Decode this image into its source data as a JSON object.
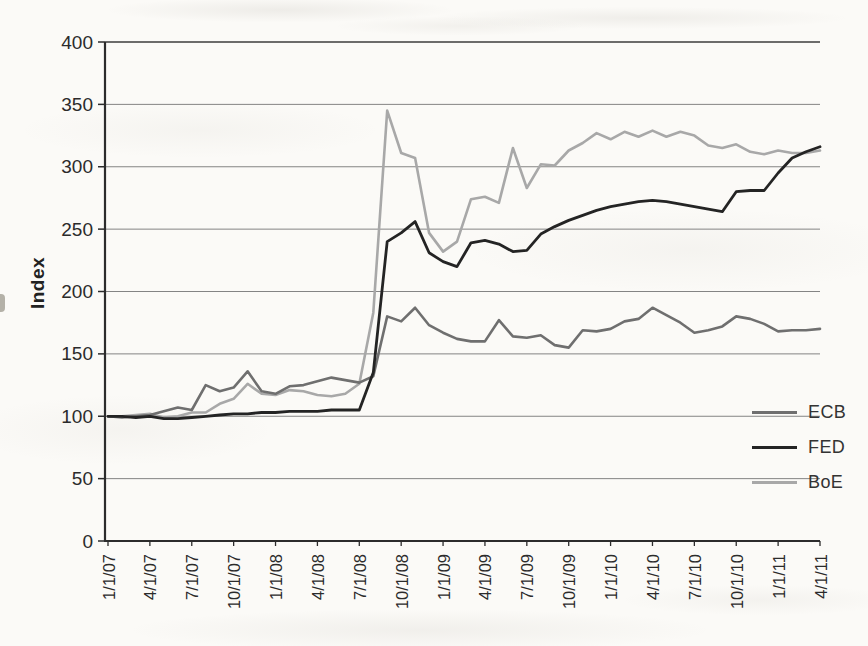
{
  "page": {
    "kind": "scanned-book-chart",
    "background": "#fbfaf7"
  },
  "colors": {
    "axis": "#2c2c2c",
    "grid": "#707070",
    "plot_top_border": "#3c3c3c",
    "tick_text": "#2b2b2b"
  },
  "chart_data": {
    "type": "line",
    "title": "",
    "xlabel": "",
    "ylabel": "Index",
    "ylim": [
      0,
      400
    ],
    "ytick_step": 50,
    "yticks": [
      0,
      50,
      100,
      150,
      200,
      250,
      300,
      350,
      400
    ],
    "grid": "horizontal",
    "legend_position": "inside-right",
    "x": [
      "1/1/07",
      "2/1/07",
      "3/1/07",
      "4/1/07",
      "5/1/07",
      "6/1/07",
      "7/1/07",
      "8/1/07",
      "9/1/07",
      "10/1/07",
      "11/1/07",
      "12/1/07",
      "1/1/08",
      "2/1/08",
      "3/1/08",
      "4/1/08",
      "5/1/08",
      "6/1/08",
      "7/1/08",
      "8/1/08",
      "9/1/08",
      "10/1/08",
      "11/1/08",
      "12/1/08",
      "1/1/09",
      "2/1/09",
      "3/1/09",
      "4/1/09",
      "5/1/09",
      "6/1/09",
      "7/1/09",
      "8/1/09",
      "9/1/09",
      "10/1/09",
      "11/1/09",
      "12/1/09",
      "1/1/10",
      "2/1/10",
      "3/1/10",
      "4/1/10",
      "5/1/10",
      "6/1/10",
      "7/1/10",
      "8/1/10",
      "9/1/10",
      "10/1/10",
      "11/1/10",
      "12/1/10",
      "1/1/11",
      "2/1/11",
      "3/1/11",
      "4/1/11"
    ],
    "xtick_labels": [
      "1/1/07",
      "4/1/07",
      "7/1/07",
      "10/1/07",
      "1/1/08",
      "4/1/08",
      "7/1/08",
      "10/1/08",
      "1/1/09",
      "4/1/09",
      "7/1/09",
      "10/1/09",
      "1/1/10",
      "4/1/10",
      "7/1/10",
      "10/1/10",
      "1/1/11",
      "4/1/11"
    ],
    "series": [
      {
        "name": "ECB",
        "color": "#6f6f6f",
        "values": [
          100,
          99,
          100,
          101,
          104,
          107,
          105,
          125,
          120,
          123,
          136,
          120,
          118,
          124,
          125,
          128,
          131,
          129,
          127,
          132,
          180,
          176,
          187,
          173,
          167,
          162,
          160,
          160,
          177,
          164,
          163,
          165,
          157,
          155,
          169,
          168,
          170,
          176,
          178,
          187,
          181,
          175,
          167,
          169,
          172,
          180,
          178,
          174,
          168,
          169,
          169,
          170
        ]
      },
      {
        "name": "FED",
        "color": "#242424",
        "values": [
          100,
          100,
          99,
          100,
          98,
          98,
          99,
          100,
          101,
          102,
          102,
          103,
          103,
          104,
          104,
          104,
          105,
          105,
          105,
          135,
          240,
          247,
          256,
          231,
          224,
          220,
          239,
          241,
          238,
          232,
          233,
          246,
          252,
          257,
          261,
          265,
          268,
          270,
          272,
          273,
          272,
          270,
          268,
          266,
          264,
          280,
          281,
          281,
          295,
          307,
          312,
          316
        ]
      },
      {
        "name": "BoE",
        "color": "#a8a8a8",
        "values": [
          100,
          100,
          101,
          102,
          99,
          100,
          103,
          103,
          110,
          114,
          126,
          118,
          117,
          121,
          120,
          117,
          116,
          118,
          126,
          183,
          345,
          311,
          307,
          247,
          232,
          240,
          274,
          276,
          271,
          315,
          283,
          302,
          301,
          313,
          319,
          327,
          322,
          328,
          324,
          329,
          324,
          328,
          325,
          317,
          315,
          318,
          312,
          310,
          313,
          311,
          311,
          313
        ]
      }
    ]
  }
}
